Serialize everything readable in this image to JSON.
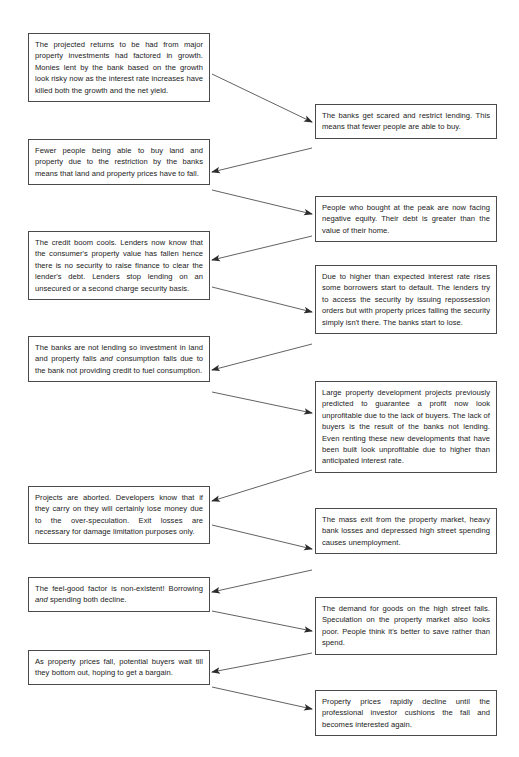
{
  "diagram": {
    "type": "flowchart",
    "orientation": "zigzag-two-column",
    "box_border_color": "#4a4a4a",
    "background_color": "#ffffff",
    "arrow_color": "#333333",
    "nodes": [
      {
        "id": "n1",
        "column": "left",
        "text": "The projected returns to be had from major property investments had factored in growth. Monies lent by the bank based on the growth look risky now as the interest rate increases have killed both the growth and the net yield."
      },
      {
        "id": "n2",
        "column": "right",
        "text": "The banks get scared and restrict lending. This means that fewer people are able to buy."
      },
      {
        "id": "n3",
        "column": "left",
        "text": "Fewer people being able to buy land and property due to the restriction by the banks means that land and property prices have to fall."
      },
      {
        "id": "n4",
        "column": "right",
        "text": "People who bought at the peak are now facing negative equity. Their debt is greater than the value of their home."
      },
      {
        "id": "n5",
        "column": "left",
        "text": "The credit boom cools. Lenders now know that the consumer's property value has fallen hence there is no security to raise finance to clear the lender's debt. Lenders stop lending on an unsecured or a second charge security basis."
      },
      {
        "id": "n6",
        "column": "right",
        "text": "Due to higher than expected interest rate rises some borrowers start to default. The lenders try to access the security by issuing repossession orders but with property prices falling the security simply isn't there. The banks start to lose."
      },
      {
        "id": "n7",
        "column": "left",
        "text_before_emphasis": "The banks are not lending so investment in land and property falls ",
        "emphasis": "and",
        "text_after_emphasis": " consumption falls due to the bank not providing credit to fuel consumption."
      },
      {
        "id": "n8",
        "column": "right",
        "text": "Large property development projects previously predicted to guarantee a profit now look unprofitable due to the lack of buyers. The lack of buyers is the result of the banks not lending. Even renting these new developments that have been built look unprofitable due to higher than anticipated interest rate."
      },
      {
        "id": "n9",
        "column": "left",
        "text": "Projects are aborted. Developers know that if they carry on they will certainly lose money due to the over-speculation. Exit losses are necessary for damage limitation purposes only."
      },
      {
        "id": "n10",
        "column": "right",
        "text": "The mass exit from the property market, heavy bank losses and depressed high street spending causes unemployment."
      },
      {
        "id": "n11",
        "column": "left",
        "text_before_emphasis": "The feel-good factor is non-existent! Borrowing ",
        "emphasis": "and",
        "text_after_emphasis": " spending both decline."
      },
      {
        "id": "n12",
        "column": "right",
        "text": "The demand for goods on the high street falls. Speculation on the property market also looks poor. People think it's better to save rather than spend."
      },
      {
        "id": "n13",
        "column": "left",
        "text": "As property prices fall, potential buyers wait till they bottom out, hoping to get a bargain."
      },
      {
        "id": "n14",
        "column": "right",
        "text": "Property prices rapidly decline until the professional investor cushions the fall and becomes interested again."
      }
    ],
    "connections": [
      {
        "from": "n1",
        "to": "n2",
        "direction": "left-to-right"
      },
      {
        "from": "n2",
        "to": "n3",
        "direction": "right-to-left"
      },
      {
        "from": "n3",
        "to": "n4",
        "direction": "left-to-right"
      },
      {
        "from": "n4",
        "to": "n5",
        "direction": "right-to-left"
      },
      {
        "from": "n5",
        "to": "n6",
        "direction": "left-to-right"
      },
      {
        "from": "n6",
        "to": "n7",
        "direction": "right-to-left"
      },
      {
        "from": "n7",
        "to": "n8",
        "direction": "left-to-right"
      },
      {
        "from": "n8",
        "to": "n9",
        "direction": "right-to-left"
      },
      {
        "from": "n9",
        "to": "n10",
        "direction": "left-to-right"
      },
      {
        "from": "n10",
        "to": "n11",
        "direction": "right-to-left"
      },
      {
        "from": "n11",
        "to": "n12",
        "direction": "left-to-right"
      },
      {
        "from": "n12",
        "to": "n13",
        "direction": "right-to-left"
      },
      {
        "from": "n13",
        "to": "n14",
        "direction": "left-to-right"
      }
    ]
  }
}
